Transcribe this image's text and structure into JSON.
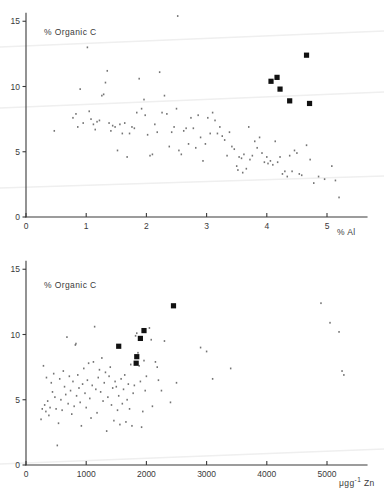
{
  "figure": {
    "background": "#ffffff",
    "ink_color": "#3a3a3a",
    "marker_color": "#111111",
    "artifact_color": "#efefef"
  },
  "chart_data": [
    {
      "id": "top",
      "type": "scatter",
      "title": "",
      "ylabel": "% Organic C",
      "xlabel": "% Al",
      "xlabel_full": "5 % Al",
      "xlim": [
        0,
        5.4
      ],
      "ylim": [
        0,
        16.2
      ],
      "xticks": [
        0,
        1,
        2,
        3,
        4,
        5
      ],
      "xticklabels": [
        "0",
        "1",
        "2",
        "3",
        "4",
        "5"
      ],
      "yticks": [
        0,
        5,
        10,
        15
      ],
      "yticklabels": [
        "0",
        "5",
        "10",
        "15"
      ],
      "grid": false,
      "legend": "none",
      "series": [
        {
          "name": "population",
          "marker": "dot",
          "points": [
            [
              0.47,
              6.6
            ],
            [
              0.78,
              7.6
            ],
            [
              0.83,
              7.9
            ],
            [
              0.86,
              6.9
            ],
            [
              0.9,
              9.8
            ],
            [
              0.95,
              7.2
            ],
            [
              1.02,
              13.0
            ],
            [
              1.05,
              8.1
            ],
            [
              1.08,
              7.5
            ],
            [
              1.12,
              7.1
            ],
            [
              1.15,
              6.7
            ],
            [
              1.18,
              7.3
            ],
            [
              1.22,
              7.4
            ],
            [
              1.26,
              9.3
            ],
            [
              1.29,
              9.4
            ],
            [
              1.32,
              10.3
            ],
            [
              1.35,
              11.2
            ],
            [
              1.38,
              7.2
            ],
            [
              1.41,
              6.6
            ],
            [
              1.44,
              7.0
            ],
            [
              1.48,
              6.9
            ],
            [
              1.52,
              5.1
            ],
            [
              1.56,
              7.1
            ],
            [
              1.6,
              6.4
            ],
            [
              1.64,
              7.2
            ],
            [
              1.68,
              4.6
            ],
            [
              1.72,
              6.4
            ],
            [
              1.76,
              6.9
            ],
            [
              1.8,
              6.8
            ],
            [
              1.84,
              8.0
            ],
            [
              1.88,
              10.6
            ],
            [
              1.92,
              8.3
            ],
            [
              1.96,
              9.0
            ],
            [
              1.98,
              7.8
            ],
            [
              2.02,
              6.3
            ],
            [
              2.06,
              4.7
            ],
            [
              2.1,
              4.8
            ],
            [
              2.14,
              7.1
            ],
            [
              2.18,
              6.5
            ],
            [
              2.22,
              11.1
            ],
            [
              2.26,
              8.0
            ],
            [
              2.3,
              9.3
            ],
            [
              2.34,
              7.9
            ],
            [
              2.38,
              5.4
            ],
            [
              2.42,
              6.5
            ],
            [
              2.46,
              6.9
            ],
            [
              2.5,
              8.3
            ],
            [
              2.52,
              15.4
            ],
            [
              2.54,
              5.1
            ],
            [
              2.58,
              4.8
            ],
            [
              2.62,
              6.6
            ],
            [
              2.66,
              6.8
            ],
            [
              2.7,
              5.6
            ],
            [
              2.74,
              7.6
            ],
            [
              2.78,
              6.8
            ],
            [
              2.82,
              5.3
            ],
            [
              2.86,
              7.8
            ],
            [
              2.9,
              6.1
            ],
            [
              2.94,
              4.3
            ],
            [
              2.98,
              5.6
            ],
            [
              3.02,
              7.6
            ],
            [
              3.06,
              6.4
            ],
            [
              3.1,
              8.0
            ],
            [
              3.14,
              7.4
            ],
            [
              3.18,
              6.4
            ],
            [
              3.22,
              6.9
            ],
            [
              3.26,
              6.2
            ],
            [
              3.3,
              5.9
            ],
            [
              3.34,
              4.7
            ],
            [
              3.38,
              6.5
            ],
            [
              3.42,
              5.4
            ],
            [
              3.46,
              5.2
            ],
            [
              3.5,
              3.9
            ],
            [
              3.52,
              3.6
            ],
            [
              3.54,
              4.6
            ],
            [
              3.58,
              4.5
            ],
            [
              3.6,
              3.4
            ],
            [
              3.62,
              4.8
            ],
            [
              3.66,
              3.7
            ],
            [
              3.7,
              6.9
            ],
            [
              3.72,
              4.4
            ],
            [
              3.76,
              4.7
            ],
            [
              3.8,
              5.8
            ],
            [
              3.84,
              5.3
            ],
            [
              3.88,
              6.1
            ],
            [
              3.92,
              4.9
            ],
            [
              3.96,
              4.2
            ],
            [
              4.0,
              4.6
            ],
            [
              4.02,
              4.1
            ],
            [
              4.06,
              4.3
            ],
            [
              4.1,
              4.0
            ],
            [
              4.14,
              5.8
            ],
            [
              4.18,
              4.2
            ],
            [
              4.22,
              4.6
            ],
            [
              4.26,
              3.3
            ],
            [
              4.3,
              3.5
            ],
            [
              4.34,
              3.1
            ],
            [
              4.38,
              4.7
            ],
            [
              4.42,
              3.5
            ],
            [
              4.46,
              5.1
            ],
            [
              4.5,
              4.9
            ],
            [
              4.54,
              3.3
            ],
            [
              4.58,
              3.2
            ],
            [
              4.66,
              5.5
            ],
            [
              4.72,
              4.4
            ],
            [
              4.78,
              2.6
            ],
            [
              4.86,
              3.1
            ],
            [
              4.96,
              2.9
            ],
            [
              5.08,
              3.9
            ],
            [
              5.14,
              2.8
            ],
            [
              5.2,
              1.5
            ]
          ]
        },
        {
          "name": "highlighted",
          "marker": "filled-square",
          "points": [
            [
              4.66,
              12.4
            ],
            [
              4.17,
              10.7
            ],
            [
              4.07,
              10.4
            ],
            [
              4.22,
              9.8
            ],
            [
              4.38,
              8.9
            ],
            [
              4.71,
              8.7
            ]
          ]
        }
      ]
    },
    {
      "id": "bottom",
      "type": "scatter",
      "title": "",
      "ylabel": "% Organic C",
      "xlabel": "μgg⁻¹ Zn",
      "xlabel_full": "5000 μgg⁻¹ Zn",
      "xlim": [
        0,
        5600
      ],
      "ylim": [
        0,
        16.2
      ],
      "xticks": [
        0,
        1000,
        2000,
        3000,
        4000,
        5000
      ],
      "xticklabels": [
        "0",
        "1000",
        "2000",
        "3000",
        "4000",
        "5000"
      ],
      "yticks": [
        0,
        5,
        10,
        15
      ],
      "yticklabels": [
        "0",
        "5",
        "10",
        "15"
      ],
      "grid": false,
      "legend": "none",
      "series": [
        {
          "name": "population",
          "marker": "dot",
          "points": [
            [
              250,
              3.5
            ],
            [
              270,
              4.3
            ],
            [
              290,
              7.6
            ],
            [
              310,
              4.6
            ],
            [
              330,
              4.1
            ],
            [
              340,
              6.7
            ],
            [
              360,
              4.9
            ],
            [
              380,
              3.8
            ],
            [
              400,
              4.4
            ],
            [
              420,
              6.3
            ],
            [
              440,
              5.6
            ],
            [
              460,
              7.0
            ],
            [
              480,
              5.2
            ],
            [
              500,
              4.3
            ],
            [
              520,
              1.5
            ],
            [
              540,
              3.2
            ],
            [
              560,
              6.6
            ],
            [
              580,
              5.0
            ],
            [
              600,
              4.2
            ],
            [
              620,
              7.2
            ],
            [
              640,
              6.0
            ],
            [
              660,
              5.4
            ],
            [
              680,
              9.8
            ],
            [
              700,
              4.7
            ],
            [
              720,
              6.8
            ],
            [
              740,
              5.7
            ],
            [
              760,
              3.9
            ],
            [
              780,
              6.4
            ],
            [
              800,
              4.5
            ],
            [
              820,
              9.2
            ],
            [
              830,
              9.3
            ],
            [
              840,
              5.3
            ],
            [
              860,
              6.9
            ],
            [
              880,
              5.9
            ],
            [
              900,
              4.8
            ],
            [
              920,
              3.0
            ],
            [
              940,
              6.2
            ],
            [
              960,
              7.4
            ],
            [
              980,
              5.5
            ],
            [
              1000,
              4.4
            ],
            [
              1020,
              6.5
            ],
            [
              1040,
              7.8
            ],
            [
              1060,
              5.1
            ],
            [
              1080,
              3.6
            ],
            [
              1100,
              6.1
            ],
            [
              1120,
              7.9
            ],
            [
              1140,
              10.6
            ],
            [
              1160,
              5.8
            ],
            [
              1180,
              4.0
            ],
            [
              1200,
              6.7
            ],
            [
              1220,
              7.3
            ],
            [
              1240,
              5.6
            ],
            [
              1260,
              8.2
            ],
            [
              1280,
              4.9
            ],
            [
              1300,
              6.3
            ],
            [
              1320,
              7.1
            ],
            [
              1340,
              2.6
            ],
            [
              1360,
              5.2
            ],
            [
              1380,
              6.8
            ],
            [
              1400,
              7.5
            ],
            [
              1420,
              4.6
            ],
            [
              1440,
              5.9
            ],
            [
              1460,
              3.4
            ],
            [
              1480,
              6.4
            ],
            [
              1500,
              6.0
            ],
            [
              1520,
              4.2
            ],
            [
              1540,
              5.3
            ],
            [
              1560,
              3.1
            ],
            [
              1580,
              6.6
            ],
            [
              1600,
              4.7
            ],
            [
              1620,
              5.8
            ],
            [
              1640,
              6.9
            ],
            [
              1660,
              3.3
            ],
            [
              1680,
              5.0
            ],
            [
              1700,
              6.2
            ],
            [
              1720,
              4.3
            ],
            [
              1740,
              7.7
            ],
            [
              1760,
              3.0
            ],
            [
              1780,
              5.5
            ],
            [
              1800,
              6.1
            ],
            [
              1820,
              9.9
            ],
            [
              1840,
              10.1
            ],
            [
              1860,
              8.6
            ],
            [
              1880,
              7.6
            ],
            [
              1900,
              6.4
            ],
            [
              1920,
              2.9
            ],
            [
              1940,
              4.1
            ],
            [
              1960,
              8.0
            ],
            [
              1980,
              5.7
            ],
            [
              2000,
              6.8
            ],
            [
              2050,
              10.5
            ],
            [
              2080,
              9.6
            ],
            [
              2100,
              4.5
            ],
            [
              2150,
              7.9
            ],
            [
              2180,
              7.5
            ],
            [
              2200,
              6.5
            ],
            [
              2250,
              5.7
            ],
            [
              2300,
              9.5
            ],
            [
              2400,
              4.8
            ],
            [
              2500,
              6.3
            ],
            [
              2900,
              9.0
            ],
            [
              3000,
              8.7
            ],
            [
              3100,
              6.6
            ],
            [
              3400,
              7.4
            ],
            [
              4900,
              12.4
            ],
            [
              5050,
              10.9
            ],
            [
              5200,
              10.2
            ],
            [
              5250,
              7.2
            ],
            [
              5280,
              6.9
            ]
          ]
        },
        {
          "name": "highlighted",
          "marker": "filled-square",
          "points": [
            [
              2450,
              12.2
            ],
            [
              1960,
              10.3
            ],
            [
              1900,
              9.7
            ],
            [
              1540,
              9.1
            ],
            [
              1840,
              8.3
            ],
            [
              1830,
              7.8
            ]
          ]
        }
      ]
    }
  ]
}
